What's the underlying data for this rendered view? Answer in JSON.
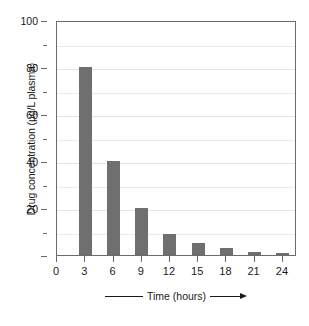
{
  "chart_data": {
    "type": "bar",
    "title": "",
    "xlabel": "Time (hours)",
    "ylabel": "Drug concentration (µg/L plasma)",
    "categories": [
      "3",
      "6",
      "9",
      "12",
      "15",
      "18",
      "21",
      "24"
    ],
    "values": [
      80,
      40,
      20,
      9,
      5,
      3,
      1.5,
      0.7
    ],
    "x_tick_labels": [
      "0",
      "3",
      "6",
      "9",
      "12",
      "15",
      "18",
      "21",
      "24"
    ],
    "y_tick_labels": [
      "0",
      "20",
      "40",
      "60",
      "80",
      "100"
    ],
    "y_major_ticks": [
      0,
      20,
      40,
      60,
      80,
      100
    ],
    "y_minor_ticks": [
      10,
      30,
      50,
      70,
      90
    ],
    "ylim": [
      0,
      100
    ],
    "xlim": [
      0,
      25.5
    ],
    "grid": true,
    "grid_axis": "y",
    "legend": "none",
    "bar_color": "#6f6f6f",
    "axis_color": "#6b6b6b",
    "grid_color": "#e8e8e8",
    "background_color": "#ffffff",
    "xlabel_arrow": "→",
    "series": [
      {
        "name": "Drug concentration",
        "points": [
          {
            "x": 3,
            "y": 80
          },
          {
            "x": 6,
            "y": 40
          },
          {
            "x": 9,
            "y": 20
          },
          {
            "x": 12,
            "y": 9
          },
          {
            "x": 15,
            "y": 5
          },
          {
            "x": 18,
            "y": 3
          },
          {
            "x": 21,
            "y": 1.5
          },
          {
            "x": 24,
            "y": 0.7
          }
        ]
      }
    ]
  }
}
